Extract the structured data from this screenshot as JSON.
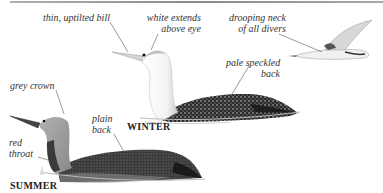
{
  "figure": {
    "seasons": {
      "winter": "WINTER",
      "summer": "SUMMER"
    },
    "annotations": {
      "bill": "thin, uptilted bill",
      "eye_line": [
        "white extends",
        "above eye"
      ],
      "neck": [
        "drooping neck",
        "of all divers"
      ],
      "winter_back": [
        "pale speckled",
        "back"
      ],
      "crown": "grey crown",
      "summer_back": [
        "plain",
        "back"
      ],
      "throat": [
        "red",
        "throat"
      ]
    },
    "colors": {
      "background": "#ffffff",
      "ink": "#333333",
      "summer_head": "#9a9a9a",
      "throat": "#3a3a3a",
      "back_dark": "#2a2a2a"
    }
  }
}
